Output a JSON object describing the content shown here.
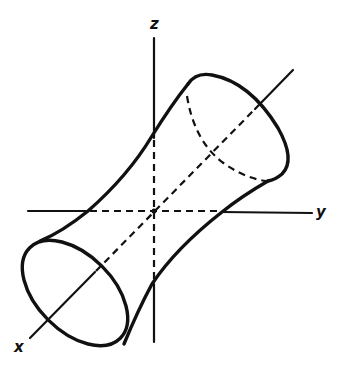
{
  "figure": {
    "axes": {
      "x_label": "x",
      "y_label": "y",
      "z_label": "z"
    },
    "colors": {
      "stroke": "#111111",
      "background": "#ffffff"
    },
    "style": {
      "hidden_lines": "dashed",
      "visible_lines": "solid"
    }
  }
}
